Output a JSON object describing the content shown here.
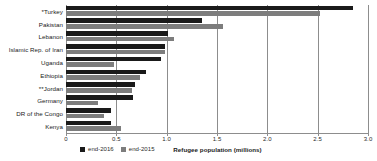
{
  "chart_data": {
    "type": "bar",
    "orientation": "horizontal",
    "title": "",
    "xlabel": "Refugee population (millions)",
    "ylabel": "",
    "xlim": [
      0,
      3.0
    ],
    "xticks": [
      0,
      0.5,
      1.0,
      1.5,
      2.0,
      2.5,
      3.0
    ],
    "xtick_labels": [
      "0",
      "0.5",
      "1.0",
      "1.5",
      "2.0",
      "2.5",
      "3.0"
    ],
    "grid": true,
    "grid_axis": "x",
    "legend_position": "bottom-left",
    "categories": [
      "*Turkey",
      "Pakistan",
      "Lebanon",
      "Islamic Rep. of Iran",
      "Uganda",
      "Ethiopia",
      "**Jordan",
      "Germany",
      "DR of the Congo",
      "Kenya"
    ],
    "series": [
      {
        "name": "end-2016",
        "color": "#1a1a1a",
        "values": [
          2.85,
          1.35,
          1.01,
          0.98,
          0.94,
          0.79,
          0.69,
          0.67,
          0.45,
          0.45
        ]
      },
      {
        "name": "end-2015",
        "color": "#7d7d7d",
        "values": [
          2.52,
          1.56,
          1.07,
          0.98,
          0.48,
          0.74,
          0.66,
          0.32,
          0.38,
          0.55
        ]
      }
    ]
  },
  "legend": {
    "items": [
      {
        "label": "end-2016",
        "color": "#1a1a1a"
      },
      {
        "label": "end-2015",
        "color": "#7d7d7d"
      }
    ]
  },
  "axis": {
    "x_title": "Refugee population (millions)"
  }
}
